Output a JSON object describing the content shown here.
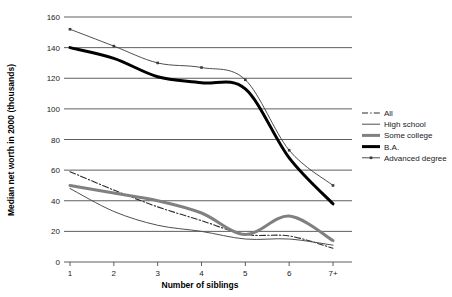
{
  "chart_data": {
    "type": "line",
    "title": "",
    "xlabel": "Number of siblings",
    "ylabel": "Median net worth in 2000 (thousands)",
    "categories": [
      "1",
      "2",
      "3",
      "4",
      "5",
      "6",
      "7+"
    ],
    "x": [
      1,
      2,
      3,
      4,
      5,
      6,
      7
    ],
    "ylim": [
      0,
      160
    ],
    "yticks": [
      0,
      20,
      40,
      60,
      80,
      100,
      120,
      140,
      160
    ],
    "ytick_labels": [
      "0",
      "20",
      "40",
      "60",
      "80",
      "100",
      "120",
      "140",
      "160"
    ],
    "grid": true,
    "grid_axis": "y",
    "legend_position": "right",
    "series": [
      {
        "name": "All",
        "values": [
          59,
          47,
          36,
          27,
          18,
          17,
          9
        ],
        "style": "dash-dot",
        "color": "#2b2b2b",
        "width": 1.1,
        "markers": false
      },
      {
        "name": "High school",
        "values": [
          48,
          33,
          24,
          20,
          15,
          15,
          11
        ],
        "style": "solid",
        "color": "#4f4f4f",
        "width": 1.0,
        "markers": false
      },
      {
        "name": "Some college",
        "values": [
          50,
          45,
          40,
          32,
          18,
          30,
          14
        ],
        "style": "solid",
        "color": "#808080",
        "width": 3.0,
        "markers": false
      },
      {
        "name": "B.A.",
        "values": [
          140,
          133,
          121,
          117,
          113,
          68,
          38
        ],
        "style": "solid",
        "color": "#000000",
        "width": 3.0,
        "markers": false
      },
      {
        "name": "Advanced degree",
        "values": [
          152,
          141,
          130,
          127,
          119,
          73,
          50
        ],
        "style": "solid",
        "color": "#3a3a3a",
        "width": 0.9,
        "markers": true
      }
    ]
  },
  "axes": {
    "x_label": "Number of siblings",
    "y_label": "Median net worth in 2000 (thousands)",
    "x_tick_labels": [
      "1",
      "2",
      "3",
      "4",
      "5",
      "6",
      "7+"
    ],
    "y_tick_labels": [
      "0",
      "20",
      "40",
      "60",
      "80",
      "100",
      "120",
      "140",
      "160"
    ]
  },
  "legend": {
    "items": [
      {
        "label": "All"
      },
      {
        "label": "High school"
      },
      {
        "label": "Some college"
      },
      {
        "label": "B.A."
      },
      {
        "label": "Advanced degree"
      }
    ]
  },
  "colors": {
    "background": "#ffffff",
    "grid": "#4d4d4d",
    "text": "#1a1a1a"
  }
}
